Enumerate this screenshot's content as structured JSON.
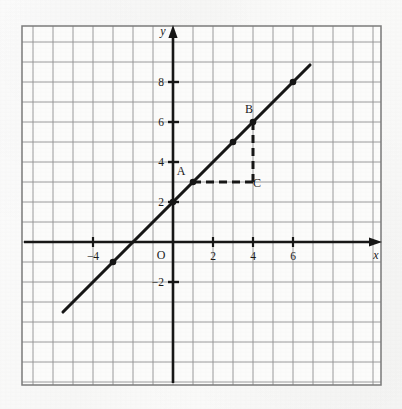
{
  "figure": {
    "kind": "coordinate-plane-line-graph",
    "background_color": "#f8f8f7",
    "ink_color": "#161616",
    "grid_color": "#8d8d8d"
  },
  "chart_data": {
    "type": "line",
    "title": "",
    "subtitle": "",
    "xlabel": "x",
    "ylabel": "y",
    "origin_label": "O",
    "grid": true,
    "grid_step": 1,
    "legend": "none",
    "xlim": [
      -7.55,
      10.4
    ],
    "ylim": [
      -7.15,
      10.8
    ],
    "x_ticks": [
      -4,
      2,
      4,
      6
    ],
    "x_tick_labels": [
      "−4",
      "2",
      "4",
      "6"
    ],
    "y_ticks": [
      -2,
      2,
      4,
      6,
      8
    ],
    "y_tick_labels": [
      "−2",
      "2",
      "4",
      "6",
      "8"
    ],
    "series": [
      {
        "name": "line",
        "equation": "y = x + 2",
        "slope": 1,
        "intercept": 2,
        "x_start": -5.5,
        "x_end": 6.85,
        "y_start": -3.5,
        "y_end": 8.85,
        "style": "solid",
        "marker": "filled-dot",
        "points": [
          {
            "x": -3,
            "y": -1,
            "label": ""
          },
          {
            "x": 0,
            "y": 2,
            "label": ""
          },
          {
            "x": 1,
            "y": 3,
            "label": "A"
          },
          {
            "x": 3,
            "y": 5,
            "label": ""
          },
          {
            "x": 4,
            "y": 6,
            "label": "B"
          },
          {
            "x": 6,
            "y": 8,
            "label": ""
          }
        ]
      }
    ],
    "annotations": {
      "points": [
        {
          "name": "A",
          "label": "A",
          "x": 1,
          "y": 3,
          "label_dx": -12,
          "label_dy": -7,
          "marker": true
        },
        {
          "name": "B",
          "label": "B",
          "x": 4,
          "y": 6,
          "label_dx": -4,
          "label_dy": -9,
          "marker": true
        },
        {
          "name": "C",
          "label": "C",
          "x": 4,
          "y": 3,
          "label_dx": 4,
          "label_dy": 5,
          "marker": false
        }
      ],
      "dashed_segments": [
        {
          "name": "AC",
          "from": {
            "x": 1,
            "y": 3
          },
          "to": {
            "x": 4,
            "y": 3
          },
          "style": "dashed",
          "orientation": "horizontal"
        },
        {
          "name": "CB",
          "from": {
            "x": 4,
            "y": 3
          },
          "to": {
            "x": 4,
            "y": 6
          },
          "style": "dashed",
          "orientation": "vertical"
        }
      ],
      "triangle": {
        "vertices": [
          "A",
          "B",
          "C"
        ],
        "run": 3,
        "rise": 3
      }
    }
  },
  "axis_arrows": {
    "x_positive": true,
    "y_positive": true
  }
}
